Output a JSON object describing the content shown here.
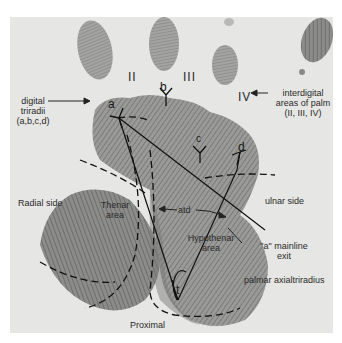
{
  "figure": {
    "labels": {
      "digital_triradii": [
        "digital",
        "triradii",
        "(a,b,c,d)"
      ],
      "interdigital": [
        "interdigital",
        "areas of palm",
        "(II, III, IV)"
      ],
      "radial_side": "Radial side",
      "ulnar_side": "ulnar side",
      "thenar": [
        "Thenar",
        "area"
      ],
      "hypothenar": [
        "Hypothenar",
        "area"
      ],
      "atd": "atd",
      "mainline_exit": [
        "\"a\" mainline",
        "exit"
      ],
      "palmar_axial_triradius": "palmar axialtriradius",
      "proximal": "Proximal"
    },
    "interdigital_numerals": [
      "II",
      "III",
      "IV"
    ],
    "triradii_letters": [
      "a",
      "b",
      "c",
      "d",
      "t"
    ],
    "colors": {
      "background": "#ffffff",
      "photo": "#e6e6e4",
      "print": "#8a8a88",
      "line": "#111111",
      "text": "#2a2a2a"
    }
  }
}
